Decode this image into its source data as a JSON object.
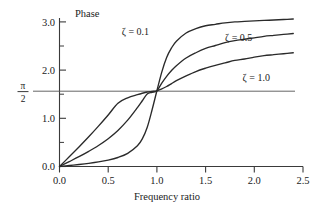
{
  "figure": {
    "name": "phase-angle-vs-frequency-ratio",
    "background_color": "#ffffff",
    "line_color": "#2a2a2a",
    "axis_color": "#3a3a3a"
  },
  "labels": {
    "y_axis_title": "Phase",
    "x_axis_title": "Frequency ratio",
    "pi_over_2_numerator": "π",
    "pi_over_2_denominator": "2"
  },
  "x_ticks": [
    "0.0",
    "0.5",
    "1.0",
    "1.5",
    "2.0",
    "2.5"
  ],
  "y_ticks": [
    "0.0",
    "1.0",
    "2.0",
    "3.0"
  ],
  "curve_labels": [
    {
      "text": "ζ = 0.1",
      "zeta": 0.1
    },
    {
      "text": "ζ = 0.5",
      "zeta": 0.5
    },
    {
      "text": "ζ = 1.0",
      "zeta": 1.0
    }
  ],
  "chart_data": {
    "type": "line",
    "title": "",
    "xlabel": "Frequency ratio",
    "ylabel": "Phase",
    "xlim": [
      0.0,
      2.5
    ],
    "ylim": [
      0.0,
      3.2
    ],
    "grid": false,
    "legend_position": "inline-annotations",
    "x_ticks": [
      0.0,
      0.5,
      1.0,
      1.5,
      2.0,
      2.5
    ],
    "y_ticks": [
      0.0,
      1.0,
      2.0,
      3.0
    ],
    "x_minor_ticks": [
      0.25,
      0.75,
      1.25,
      1.75,
      2.25
    ],
    "y_minor_ticks": [
      0.5,
      1.5,
      2.5
    ],
    "reference_lines": [
      {
        "label": "π/2",
        "orientation": "horizontal",
        "value": 1.5708,
        "x_from": 0.0,
        "x_to": 2.45
      }
    ],
    "annotations": [
      {
        "text": "ζ = 0.1",
        "x": 0.78,
        "y": 2.72
      },
      {
        "text": "ζ = 0.5",
        "x": 1.84,
        "y": 2.6
      },
      {
        "text": "ζ = 1.0",
        "x": 2.02,
        "y": 1.78
      }
    ],
    "x": [
      0.0,
      0.1,
      0.2,
      0.3,
      0.4,
      0.5,
      0.6,
      0.7,
      0.8,
      0.85,
      0.9,
      0.95,
      1.0,
      1.05,
      1.1,
      1.15,
      1.2,
      1.3,
      1.4,
      1.5,
      1.6,
      1.7,
      1.8,
      1.9,
      2.0,
      2.1,
      2.2,
      2.3,
      2.4
    ],
    "series": [
      {
        "name": "ζ = 0.1",
        "zeta": 0.1,
        "values": [
          0.0,
          0.02,
          0.042,
          0.066,
          0.095,
          0.133,
          0.187,
          0.272,
          0.429,
          0.572,
          0.809,
          1.172,
          1.571,
          1.958,
          2.26,
          2.46,
          2.6,
          2.77,
          2.86,
          2.92,
          2.95,
          2.98,
          3.0,
          3.01,
          3.02,
          3.03,
          3.04,
          3.05,
          3.06
        ]
      },
      {
        "name": "ζ = 0.5",
        "zeta": 0.5,
        "values": [
          0.0,
          0.101,
          0.204,
          0.315,
          0.436,
          0.577,
          0.748,
          0.961,
          1.222,
          1.364,
          1.505,
          1.54,
          1.571,
          1.73,
          1.87,
          1.99,
          2.09,
          2.25,
          2.36,
          2.45,
          2.51,
          2.57,
          2.61,
          2.64,
          2.67,
          2.7,
          2.72,
          2.74,
          2.76
        ]
      },
      {
        "name": "ζ = 1.0",
        "zeta": 1.0,
        "values": [
          0.0,
          0.201,
          0.406,
          0.617,
          0.838,
          1.069,
          1.312,
          1.424,
          1.49,
          1.52,
          1.545,
          1.558,
          1.571,
          1.61,
          1.66,
          1.72,
          1.78,
          1.88,
          1.97,
          2.04,
          2.1,
          2.15,
          2.2,
          2.23,
          2.27,
          2.3,
          2.32,
          2.34,
          2.36
        ]
      }
    ]
  }
}
